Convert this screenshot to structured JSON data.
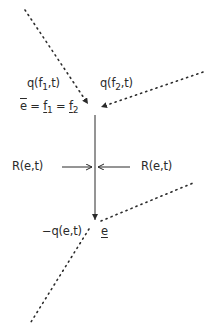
{
  "diagram": {
    "type": "flow-junction",
    "colors": {
      "line": "#2a2a2a",
      "background": "#ffffff"
    },
    "labels": {
      "q_f1": {
        "prefix": "q(f",
        "sub": "1",
        "suffix": ",t)"
      },
      "q_f2": {
        "prefix": "q(f",
        "sub": "2",
        "suffix": ",t)"
      },
      "equality": {
        "ebar": "e",
        "eq1": " = ",
        "f1": "f",
        "f1_sub": "1",
        "eq2": " = ",
        "f2": "f",
        "f2_sub": "2"
      },
      "R_left": "R(e,t)",
      "R_right": "R(e,t)",
      "neg_q": "−q(e,t)",
      "e_under": "e"
    },
    "edges": [
      {
        "name": "dotted-incoming-f1",
        "style": "dotted",
        "from": [
          25,
          10
        ],
        "to": [
          90,
          107
        ],
        "arrow": "end"
      },
      {
        "name": "dotted-incoming-f2",
        "style": "dotted",
        "from": [
          203,
          72
        ],
        "to": [
          99,
          108
        ],
        "arrow": "end"
      },
      {
        "name": "solid-vertical-edge",
        "style": "solid",
        "from": [
          95,
          115
        ],
        "to": [
          95,
          222
        ],
        "arrow": "end"
      },
      {
        "name": "R-arrow-left",
        "style": "solid",
        "from": [
          62,
          167
        ],
        "to": [
          92,
          167
        ],
        "arrow": "end"
      },
      {
        "name": "R-arrow-right",
        "style": "solid",
        "from": [
          130,
          167
        ],
        "to": [
          98,
          167
        ],
        "arrow": "end"
      },
      {
        "name": "dotted-outgoing-right",
        "style": "dotted",
        "from": [
          100,
          222
        ],
        "to": [
          193,
          183
        ],
        "arrow": "none"
      },
      {
        "name": "dotted-outgoing-left",
        "style": "dotted",
        "from": [
          88,
          229
        ],
        "to": [
          31,
          322
        ],
        "arrow": "none"
      }
    ]
  }
}
